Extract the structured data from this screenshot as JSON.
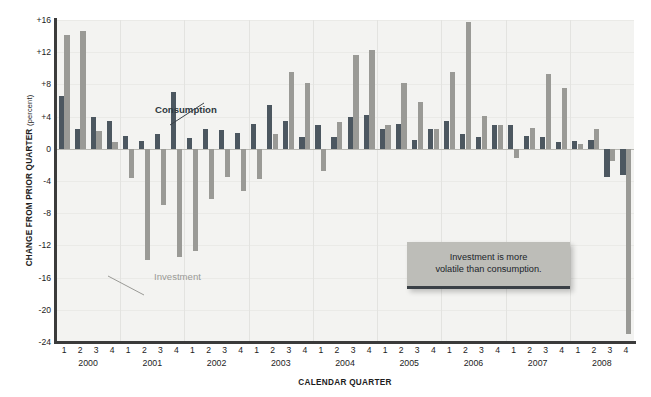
{
  "chart_data": {
    "type": "bar",
    "title": "",
    "xlabel": "CALENDAR QUARTER",
    "ylabel": "CHANGE FROM PRIOR QUARTER",
    "ylabel_unit": "(percent)",
    "ylim": [
      -24,
      16
    ],
    "yticks": [
      "+16",
      "+12",
      "+8",
      "+4",
      "0",
      "-4",
      "-8",
      "-12",
      "-16",
      "-20",
      "-24"
    ],
    "ytick_values": [
      16,
      12,
      8,
      4,
      0,
      -4,
      -8,
      -12,
      -16,
      -20,
      -24
    ],
    "grid": "vertical-yearly",
    "legend_position": "inline-annotation",
    "years": [
      "2000",
      "2001",
      "2002",
      "2003",
      "2004",
      "2005",
      "2006",
      "2007",
      "2008"
    ],
    "quarters": [
      "1",
      "2",
      "3",
      "4"
    ],
    "categories": [
      "2000 Q1",
      "2000 Q2",
      "2000 Q3",
      "2000 Q4",
      "2001 Q1",
      "2001 Q2",
      "2001 Q3",
      "2001 Q4",
      "2002 Q1",
      "2002 Q2",
      "2002 Q3",
      "2002 Q4",
      "2003 Q1",
      "2003 Q2",
      "2003 Q3",
      "2003 Q4",
      "2004 Q1",
      "2004 Q2",
      "2004 Q3",
      "2004 Q4",
      "2005 Q1",
      "2005 Q2",
      "2005 Q3",
      "2005 Q4",
      "2006 Q1",
      "2006 Q2",
      "2006 Q3",
      "2006 Q4",
      "2007 Q1",
      "2007 Q2",
      "2007 Q3",
      "2007 Q4",
      "2008 Q1",
      "2008 Q2",
      "2008 Q3",
      "2008 Q4"
    ],
    "series": [
      {
        "name": "Consumption",
        "color": "#4c5760",
        "values": [
          6.6,
          2.5,
          4.0,
          3.5,
          1.6,
          1.0,
          1.8,
          7.0,
          1.4,
          2.4,
          2.3,
          2.0,
          3.1,
          5.5,
          3.4,
          1.5,
          3.0,
          1.5,
          4.0,
          4.2,
          2.5,
          3.1,
          1.1,
          2.4,
          3.5,
          1.9,
          1.5,
          2.9,
          3.0,
          1.6,
          1.5,
          0.9,
          1.0,
          1.1,
          -3.5,
          -3.2
        ]
      },
      {
        "name": "Investment",
        "color": "#9a9a96",
        "values": [
          14.1,
          14.6,
          2.2,
          0.8,
          -3.6,
          -13.8,
          -7.0,
          -13.5,
          -12.7,
          -6.2,
          -3.5,
          -5.3,
          -3.8,
          1.9,
          9.5,
          8.2,
          -2.7,
          3.3,
          11.7,
          12.3,
          3.0,
          8.2,
          5.8,
          2.4,
          9.6,
          15.7,
          4.1,
          2.9,
          -1.1,
          2.6,
          9.3,
          7.6,
          0.6,
          2.5,
          -1.5,
          -23.0
        ]
      }
    ],
    "annotations": [
      {
        "name": "consumption-label",
        "text": "Consumption"
      },
      {
        "name": "investment-label",
        "text": "Investment"
      }
    ],
    "callout": {
      "line1": "Investment is more",
      "line2": "volatile than consumption."
    }
  }
}
